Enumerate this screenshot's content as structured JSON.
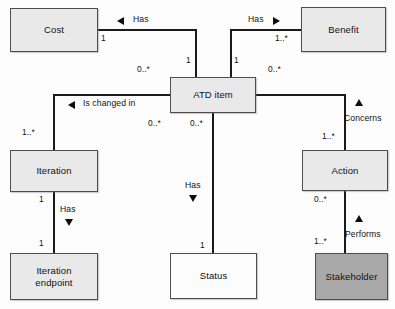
{
  "diagram": {
    "type": "uml-class-diagram",
    "canvas": {
      "width": 395,
      "height": 309
    },
    "colors": {
      "node_fill_light": "#e9e9e9",
      "node_fill_dark": "#a9a9a9",
      "node_fill_plain": "#fcfcfc",
      "node_border": "#4d4d4d",
      "edge": "#1a1a1a",
      "text": "#111111",
      "background": "#fdfdfd"
    },
    "nodes": [
      {
        "id": "cost",
        "label": "Cost",
        "fill": "light",
        "x": 10,
        "y": 8,
        "w": 88,
        "h": 44
      },
      {
        "id": "benefit",
        "label": "Benefit",
        "fill": "light",
        "x": 301,
        "y": 7,
        "w": 85,
        "h": 45
      },
      {
        "id": "atd",
        "label": "ATD item",
        "fill": "light",
        "x": 170,
        "y": 77,
        "w": 86,
        "h": 36
      },
      {
        "id": "iteration",
        "label": "Iteration",
        "fill": "light",
        "x": 10,
        "y": 150,
        "w": 88,
        "h": 42
      },
      {
        "id": "action",
        "label": "Action",
        "fill": "light",
        "x": 302,
        "y": 150,
        "w": 86,
        "h": 41
      },
      {
        "id": "iterend",
        "label": "Iteration\nendpoint",
        "fill": "light",
        "x": 10,
        "y": 253,
        "w": 88,
        "h": 47
      },
      {
        "id": "status",
        "label": "Status",
        "fill": "plain",
        "x": 170,
        "y": 253,
        "w": 87,
        "h": 46
      },
      {
        "id": "stake",
        "label": "Stakeholder",
        "fill": "dark",
        "x": 315,
        "y": 253,
        "w": 73,
        "h": 47
      }
    ],
    "edges": [
      {
        "id": "cost-atd",
        "source": "atd",
        "target": "cost",
        "label": "Has",
        "direction": "left",
        "source_mult": "1",
        "target_mult": "0..*"
      },
      {
        "id": "atd-benefit",
        "source": "atd",
        "target": "benefit",
        "label": "Has",
        "direction": "right",
        "source_mult": "1",
        "target_mult": "1..*"
      },
      {
        "id": "iteration-atd",
        "source": "iteration",
        "target": "atd",
        "label": "Is changed in",
        "direction": "left",
        "source_mult": "1..*",
        "target_mult": "0..*"
      },
      {
        "id": "atd-status",
        "source": "atd",
        "target": "status",
        "label": "Has",
        "direction": "down",
        "source_mult": "0..*",
        "target_mult": "1"
      },
      {
        "id": "action-atd",
        "source": "action",
        "target": "atd",
        "label": "Concerns",
        "direction": "up",
        "source_mult": "1..*",
        "target_mult": "0..*"
      },
      {
        "id": "iter-iterend",
        "source": "iteration",
        "target": "iterend",
        "label": "Has",
        "direction": "down",
        "source_mult": "1",
        "target_mult": "1"
      },
      {
        "id": "stake-action",
        "source": "stake",
        "target": "action",
        "label": "Performs",
        "direction": "up",
        "source_mult": "1..*",
        "target_mult": "0..*"
      }
    ],
    "labels": {
      "has_cost": "Has",
      "has_benefit": "Has",
      "is_changed_in": "Is changed in",
      "has_status": "Has",
      "concerns": "Concerns",
      "has_iteration_endpoint": "Has",
      "performs": "Performs"
    },
    "multiplicities": {
      "cost_end": "1",
      "atd_to_cost": "0..*",
      "atd_to_benefit": "1",
      "benefit_end": "1..*",
      "iteration_end": "1..*",
      "atd_to_iteration": "0..*",
      "atd_to_status": "0..*",
      "status_end": "1",
      "atd_to_action": "0..*",
      "action_to_atd": "1..*",
      "iteration_bottom": "1",
      "iterend_top": "1",
      "action_bottom": "0..*",
      "stake_top": "1..*"
    }
  }
}
